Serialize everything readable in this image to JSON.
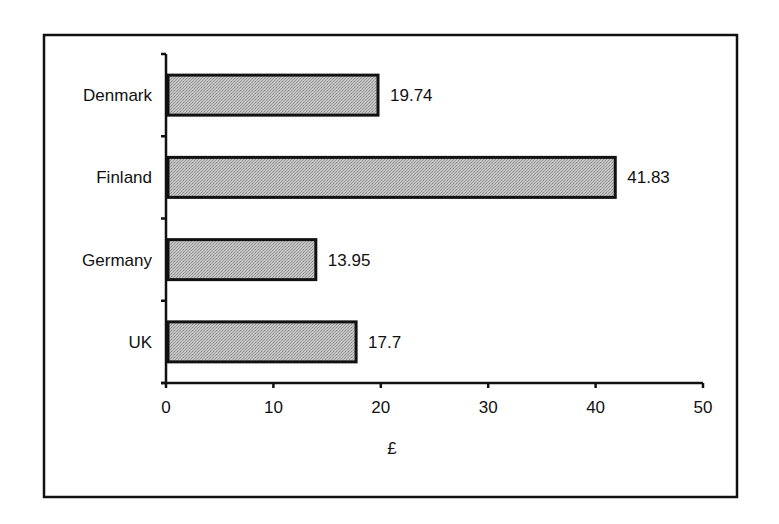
{
  "chart_data": {
    "type": "bar",
    "orientation": "horizontal",
    "title": "",
    "xlabel": "£",
    "ylabel": "",
    "categories": [
      "Denmark",
      "Finland",
      "Germany",
      "UK"
    ],
    "values": [
      19.74,
      41.83,
      13.95,
      17.7
    ],
    "data_labels": [
      "19.74",
      "41.83",
      "13.95",
      "17.7"
    ],
    "xlim": [
      0,
      50
    ],
    "xticks": [
      0,
      10,
      20,
      30,
      40,
      50
    ],
    "xtick_labels": [
      "0",
      "10",
      "20",
      "30",
      "40",
      "50"
    ],
    "grid": false,
    "legend": "none",
    "bar_fill": "#b8b8b8",
    "bar_stroke": "#111111"
  }
}
